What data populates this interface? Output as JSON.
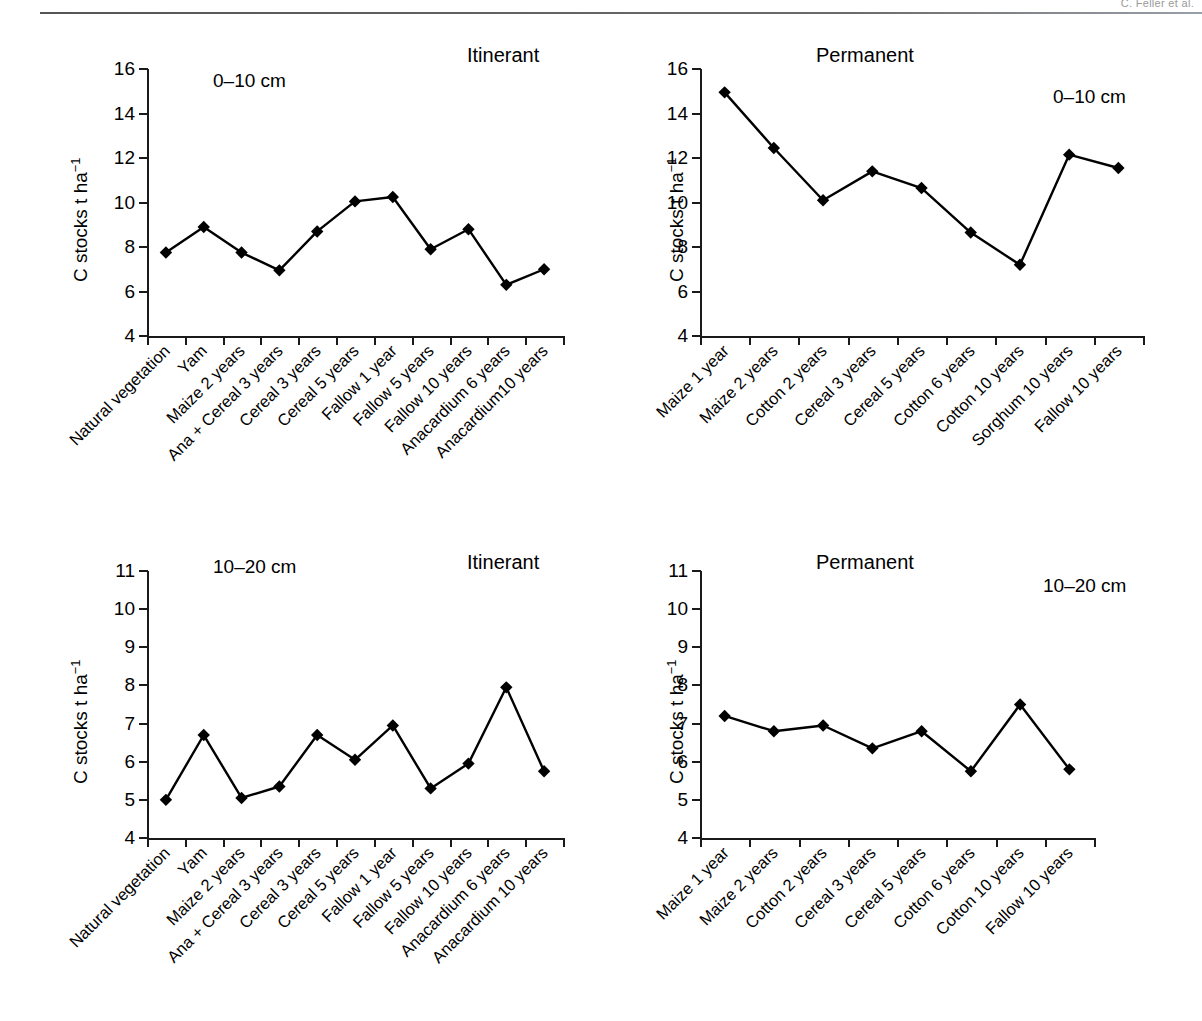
{
  "header": {
    "running_head": "C. Feller et al."
  },
  "axis_common": {
    "ylabel_prefix": "C stocks t ha",
    "ylabel_exponent": "−1"
  },
  "panels": [
    {
      "id": "top-left",
      "title": "Itinerant",
      "depth": "0–10 cm",
      "ylabel": "C stocks t ha",
      "yticks": [
        4,
        6,
        8,
        10,
        12,
        14,
        16
      ],
      "ylim": [
        4,
        16
      ]
    },
    {
      "id": "top-right",
      "title": "Permanent",
      "depth": "0–10 cm",
      "ylabel": "C stocks t ha",
      "yticks": [
        4,
        6,
        8,
        10,
        12,
        14,
        16
      ],
      "ylim": [
        4,
        16
      ]
    },
    {
      "id": "bottom-left",
      "title": "Itinerant",
      "depth": "10–20 cm",
      "ylabel": "C stocks t ha",
      "yticks": [
        4,
        5,
        6,
        7,
        8,
        9,
        10,
        11
      ],
      "ylim": [
        4,
        11
      ]
    },
    {
      "id": "bottom-right",
      "title": "Permanent",
      "depth": "10–20 cm",
      "ylabel": "C stocks t ha",
      "yticks": [
        4,
        5,
        6,
        7,
        8,
        9,
        10,
        11
      ],
      "ylim": [
        4,
        11
      ]
    }
  ],
  "chart_data": [
    {
      "type": "line",
      "title": "Itinerant",
      "subtitle": "0–10 cm",
      "xlabel": "",
      "ylabel": "C stocks t ha⁻¹",
      "ylim": [
        4,
        16
      ],
      "yticks": [
        4,
        6,
        8,
        10,
        12,
        14,
        16
      ],
      "grid": false,
      "legend": "none",
      "marker": "filled-diamond",
      "categories": [
        "Natural vegetation",
        "Yam",
        "Maize 2 years",
        "Ana + Cereal 3 years",
        "Cereal 3 years",
        "Cereal 5 years",
        "Fallow 1 year",
        "Fallow 5 years",
        "Fallow 10 years",
        "Anacardium  6 years",
        "Anacardium10 years"
      ],
      "values": [
        7.75,
        8.9,
        7.75,
        6.95,
        8.7,
        10.05,
        10.25,
        7.9,
        8.8,
        6.3,
        7.0
      ]
    },
    {
      "type": "line",
      "title": "Permanent",
      "subtitle": "0–10 cm",
      "xlabel": "",
      "ylabel": "C stocks t ha⁻¹",
      "ylim": [
        4,
        16
      ],
      "yticks": [
        4,
        6,
        8,
        10,
        12,
        14,
        16
      ],
      "grid": false,
      "legend": "none",
      "marker": "filled-diamond",
      "categories": [
        "Maize 1 year",
        "Maize 2 years",
        "Cotton 2 years",
        "Cereal 3 years",
        "Cereal 5 years",
        "Cotton 6 years",
        "Cotton 10 years",
        "Sorghum 10 years",
        "Fallow 10 years"
      ],
      "values": [
        14.95,
        12.45,
        10.1,
        11.4,
        10.65,
        8.65,
        7.2,
        12.15,
        11.55
      ]
    },
    {
      "type": "line",
      "title": "Itinerant",
      "subtitle": "10–20 cm",
      "xlabel": "",
      "ylabel": "C stocks t ha⁻¹",
      "ylim": [
        4,
        11
      ],
      "yticks": [
        4,
        5,
        6,
        7,
        8,
        9,
        10,
        11
      ],
      "grid": false,
      "legend": "none",
      "marker": "filled-diamond",
      "categories": [
        "Natural vegetation",
        "Yam",
        "Maize 2 years",
        "Ana + Cereal 3 years",
        "Cereal 3 years",
        "Cereal 5 years",
        "Fallow 1 year",
        "Fallow 5 years",
        "Fallow 10 years",
        "Anacardium 6 years",
        "Anacardium 10 years"
      ],
      "values": [
        5.0,
        6.7,
        5.05,
        5.35,
        6.7,
        6.05,
        6.95,
        5.3,
        5.95,
        7.95,
        5.75
      ]
    },
    {
      "type": "line",
      "title": "Permanent",
      "subtitle": "10–20 cm",
      "xlabel": "",
      "ylabel": "C stocks t ha⁻¹",
      "ylim": [
        4,
        11
      ],
      "yticks": [
        4,
        5,
        6,
        7,
        8,
        9,
        10,
        11
      ],
      "grid": false,
      "legend": "none",
      "marker": "filled-diamond",
      "categories": [
        "Maize 1 year",
        "Maize 2 years",
        "Cotton 2 years",
        "Cereal 3 years",
        "Cereal 5 years",
        "Cotton 6 years",
        "Cotton 10 years",
        "Fallow 10 years"
      ],
      "values": [
        7.2,
        6.8,
        6.95,
        6.35,
        6.8,
        5.75,
        7.5,
        5.8
      ]
    }
  ],
  "colors": {
    "ink": "#1a1a1a",
    "series": "#000000",
    "header_rule": "#5a5a5a",
    "header_text": "#9a9a9a"
  }
}
